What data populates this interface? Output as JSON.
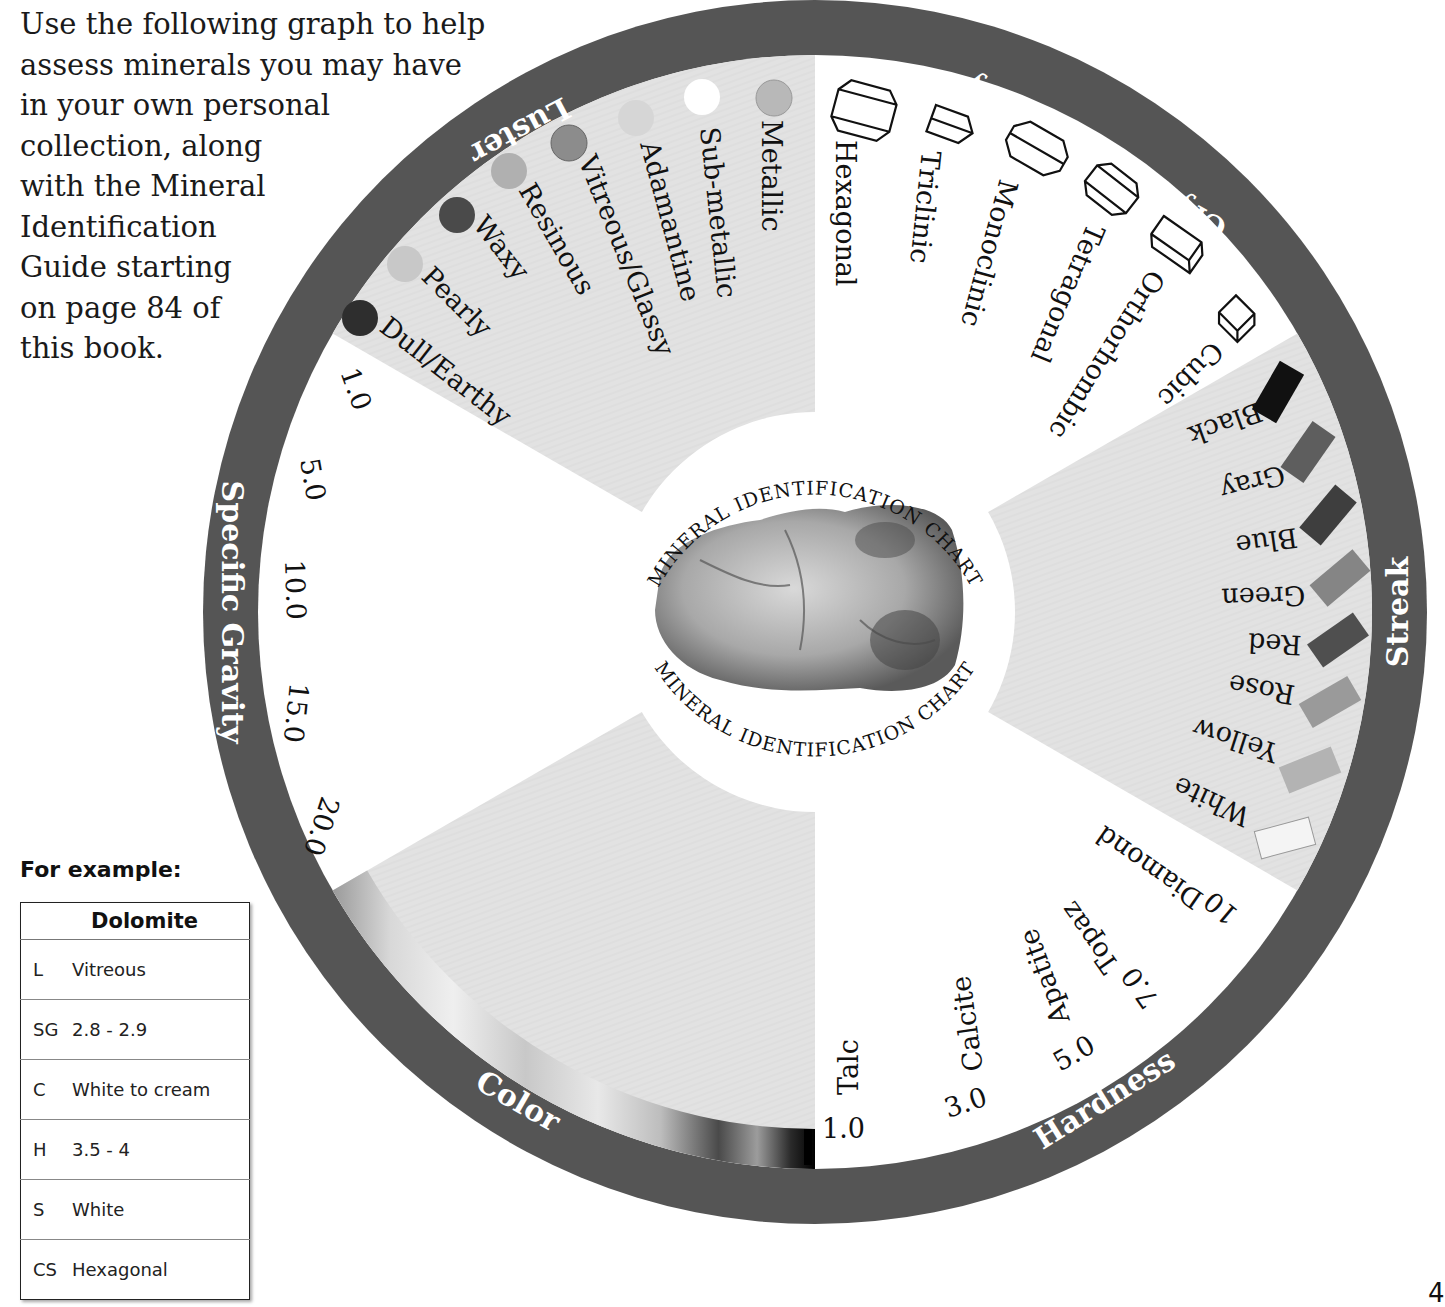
{
  "intro": {
    "lines": [
      "Use the following graph to help",
      "assess minerals you may have",
      "in your own personal",
      "collection, along",
      "with the Mineral",
      "Identification",
      "Guide starting",
      "on page 84 of",
      "this book."
    ]
  },
  "example": {
    "title": "For example:",
    "mineral": "Dolomite",
    "rows": [
      {
        "key": "L",
        "value": "Vitreous"
      },
      {
        "key": "SG",
        "value": "2.8 - 2.9"
      },
      {
        "key": "C",
        "value": "White to cream"
      },
      {
        "key": "H",
        "value": "3.5 - 4"
      },
      {
        "key": "S",
        "value": "White"
      },
      {
        "key": "CS",
        "value": "Hexagonal"
      }
    ]
  },
  "wheel": {
    "center_title_top": "MINERAL IDENTIFICATION CHART",
    "center_title_bottom": "MINERAL IDENTIFICATION CHART",
    "colors": {
      "ring": "#555555",
      "sector_gray": "#e3e3e3",
      "sector_white": "#ffffff"
    },
    "sections": {
      "luster": {
        "title": "Luster",
        "items": [
          "Metallic",
          "Sub-metallic",
          "Adamantine",
          "Vitreous/Glassy",
          "Resinous",
          "Waxy",
          "Pearly",
          "Dull/Earthy"
        ],
        "swatch_tones": [
          "#b8b8b8",
          "#ffffff",
          "#d6d6d6",
          "#8c8c8c",
          "#b0b0b0",
          "#4a4a4a",
          "#c8c8c8",
          "#2e2e2e"
        ]
      },
      "crystal_symmetry": {
        "title": "Crystal Symmetry",
        "items": [
          "Hexagonal",
          "Triclinic",
          "Monoclinic",
          "Tetragonal",
          "Orthorhombic",
          "Cubic"
        ]
      },
      "streak": {
        "title": "Streak",
        "items": [
          "Black",
          "Gray",
          "Blue",
          "Green",
          "Red",
          "Rose",
          "Yellow",
          "White"
        ],
        "swatch_tones": [
          "#111111",
          "#5e5e5e",
          "#3e3e3e",
          "#858585",
          "#4f4f4f",
          "#9a9a9a",
          "#b3b3b3",
          "#f2f2f2"
        ]
      },
      "hardness": {
        "title": "Hardness",
        "values": [
          "1.0",
          "3.0",
          "5.0",
          "7.0",
          "10"
        ],
        "minerals": [
          "Talc",
          "Calcite",
          "Apatite",
          "Topaz",
          "Diamond"
        ]
      },
      "color": {
        "title": "Color"
      },
      "specific_gravity": {
        "title": "Specific Gravity",
        "values": [
          "1.0",
          "5.0",
          "10.0",
          "15.0",
          "20.0"
        ]
      }
    }
  },
  "page_number": "4"
}
